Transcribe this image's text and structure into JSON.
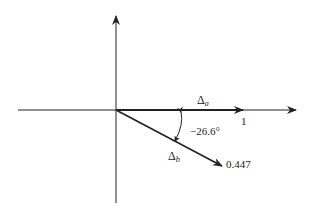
{
  "diagram": {
    "type": "phasor",
    "vectors": [
      {
        "name": "Δa",
        "label_main": "Δ",
        "label_sub": "a",
        "magnitude": 1,
        "magnitude_label": "1",
        "angle_deg": 0
      },
      {
        "name": "Δb",
        "label_main": "Δ",
        "label_sub": "b",
        "magnitude": 0.447,
        "magnitude_label": "0.447",
        "angle_deg": -26.6
      }
    ],
    "angle_label": "−26.6°",
    "colors": {
      "ink": "#222222",
      "background": "#ffffff"
    }
  }
}
